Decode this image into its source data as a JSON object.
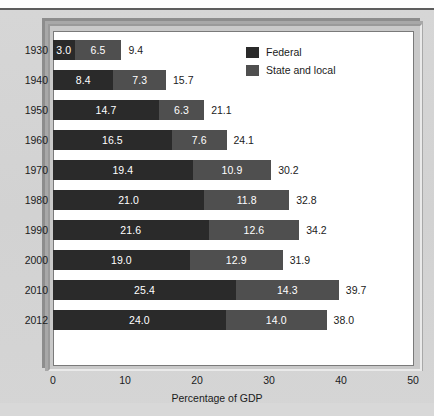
{
  "chart_data": {
    "type": "bar",
    "orientation": "horizontal",
    "stacked": true,
    "title": "",
    "xlabel": "Percentage of GDP",
    "ylabel": "",
    "xlim": [
      0,
      50
    ],
    "xticks": [
      0,
      10,
      20,
      30,
      40,
      50
    ],
    "xtick_labels": [
      "0",
      "10",
      "20",
      "30",
      "40",
      "50"
    ],
    "grid": false,
    "legend_position": "top-right",
    "categories": [
      "1930",
      "1940",
      "1950",
      "1960",
      "1970",
      "1980",
      "1990",
      "2000",
      "2010",
      "2012"
    ],
    "series": [
      {
        "name": "Federal",
        "color": "#2a2a2a",
        "values": [
          3.0,
          8.4,
          14.7,
          16.5,
          19.4,
          21.0,
          21.6,
          19.0,
          25.4,
          24.0
        ],
        "labels": [
          "3.0",
          "8.4",
          "14.7",
          "16.5",
          "19.4",
          "21.0",
          "21.6",
          "19.0",
          "25.4",
          "24.0"
        ]
      },
      {
        "name": "State and local",
        "color": "#4f4f4f",
        "values": [
          6.5,
          7.3,
          6.3,
          7.6,
          10.9,
          11.8,
          12.6,
          12.9,
          14.3,
          14.0
        ],
        "labels": [
          "6.5",
          "7.3",
          "6.3",
          "7.6",
          "10.9",
          "11.8",
          "12.6",
          "12.9",
          "14.3",
          "14.0"
        ]
      }
    ],
    "totals": [
      9.4,
      15.7,
      21.1,
      24.1,
      30.2,
      32.8,
      34.2,
      31.9,
      39.7,
      38.0
    ],
    "total_labels": [
      "9.4",
      "15.7",
      "21.1",
      "24.1",
      "30.2",
      "32.8",
      "34.2",
      "31.9",
      "39.7",
      "38.0"
    ]
  },
  "legend": {
    "items": [
      {
        "label": "Federal",
        "swatch": "federal-swatch"
      },
      {
        "label": "State and local",
        "swatch": "state-and-local-swatch"
      }
    ]
  },
  "colors": {
    "federal": "#2a2a2a",
    "state_and_local": "#4f4f4f",
    "page_background": "#d4d4d4",
    "plot_background": "#ffffff",
    "frame": "#c9c9c9",
    "text": "#1b1b1b"
  }
}
